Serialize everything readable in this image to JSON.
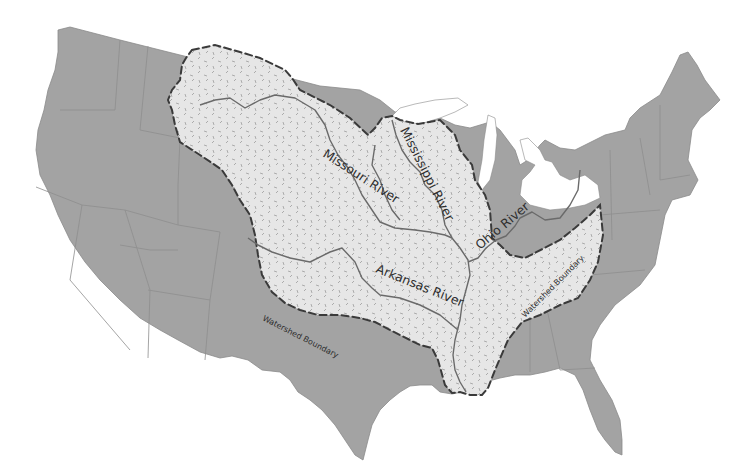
{
  "map": {
    "subject": "Mississippi River Watershed",
    "region": "Contiguous United States",
    "colors": {
      "land": "#a3a3a3",
      "state_border": "#8e8e8e",
      "watershed_fill": "#e6e6e6",
      "watershed_texture": "#9c9c9c",
      "boundary_line": "#3a3a3a",
      "river_line": "#6a6a6a",
      "water": "#ffffff"
    },
    "labels": {
      "missouri": "Missouri River",
      "mississippi": "Mississippi River",
      "ohio": "Ohio River",
      "arkansas": "Arkansas River",
      "boundary_west": "Watershed Boundary",
      "boundary_east": "Watershed Boundary"
    },
    "features": [
      {
        "name": "watershed-boundary",
        "style": "dashed"
      },
      {
        "name": "missouri-river",
        "style": "solid"
      },
      {
        "name": "mississippi-river",
        "style": "solid"
      },
      {
        "name": "ohio-river",
        "style": "solid"
      },
      {
        "name": "arkansas-river",
        "style": "solid"
      }
    ]
  }
}
